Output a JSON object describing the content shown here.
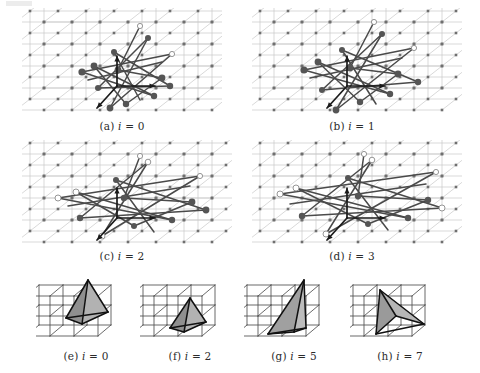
{
  "figure": {
    "kind": "multi-panel-scientific-figure",
    "background": "#ffffff",
    "rows": 3,
    "panel_count": 8
  },
  "colors": {
    "lattice_line": "#c9c9c9",
    "lattice_node": "#6f6f6f",
    "graph_edge": "#4a4a4a",
    "graph_node_dark": "#555555",
    "graph_node_hollow_fill": "#ffffff",
    "graph_node_hollow_stroke": "#8a8a8a",
    "axis_arrow": "#1a1a1a",
    "cube_wire": "#4f4f4f",
    "tetra_fill": "#9a9a9a",
    "tetra_fill_light": "#b4b4b4",
    "tetra_stroke": "#111111",
    "caption_text": "#2b2b2b"
  },
  "captions": {
    "a": {
      "tag": "(a)",
      "var": "i",
      "eq": "=",
      "value": "0",
      "full": "(a) i = 0"
    },
    "b": {
      "tag": "(b)",
      "var": "i",
      "eq": "=",
      "value": "1",
      "full": "(b) i = 1"
    },
    "c": {
      "tag": "(c)",
      "var": "i",
      "eq": "=",
      "value": "2",
      "full": "(c) i = 2"
    },
    "d": {
      "tag": "(d)",
      "var": "i",
      "eq": "=",
      "value": "3",
      "full": "(d) i = 3"
    },
    "e": {
      "tag": "(e)",
      "var": "i",
      "eq": "=",
      "value": "0",
      "full": "(e) i = 0"
    },
    "f": {
      "tag": "(f)",
      "var": "i",
      "eq": "=",
      "value": "2",
      "full": "(f) i = 2"
    },
    "g": {
      "tag": "(g)",
      "var": "i",
      "eq": "=",
      "value": "5",
      "full": "(g) i = 5"
    },
    "h": {
      "tag": "(h)",
      "var": "i",
      "eq": "=",
      "value": "7",
      "full": "(h) i = 7"
    }
  },
  "lattice": {
    "description": "3D cubic point lattice drawn in oblique projection",
    "cols": 8,
    "rows": 5,
    "depth_layers": 3,
    "cell_width": 28,
    "cell_height": 22,
    "depth_dx": 14,
    "depth_dy": -11,
    "node_size": 2.6
  },
  "graph_panels": [
    {
      "id": "a",
      "caption_key": "a",
      "spread": 0.0,
      "edge_count": 14,
      "node_count": 13,
      "hollow_nodes": 2,
      "has_axis_triad": true,
      "edges": [
        [
          118,
          18,
          96,
          62
        ],
        [
          96,
          62,
          140,
          70
        ],
        [
          140,
          70,
          104,
          96
        ],
        [
          104,
          96,
          72,
          58
        ],
        [
          72,
          58,
          132,
          88
        ],
        [
          132,
          88,
          60,
          64
        ],
        [
          60,
          64,
          150,
          46
        ],
        [
          150,
          46,
          88,
          100
        ],
        [
          88,
          100,
          126,
          30
        ],
        [
          126,
          30,
          76,
          80
        ],
        [
          76,
          80,
          148,
          78
        ],
        [
          148,
          78,
          92,
          44
        ],
        [
          92,
          44,
          118,
          92
        ],
        [
          66,
          72,
          140,
          54
        ]
      ],
      "nodes": [
        {
          "x": 96,
          "y": 62,
          "r": 3.4,
          "hollow": false
        },
        {
          "x": 140,
          "y": 70,
          "r": 3.4,
          "hollow": false
        },
        {
          "x": 104,
          "y": 96,
          "r": 3.2,
          "hollow": false
        },
        {
          "x": 72,
          "y": 58,
          "r": 3.4,
          "hollow": false
        },
        {
          "x": 132,
          "y": 88,
          "r": 3.2,
          "hollow": false
        },
        {
          "x": 60,
          "y": 64,
          "r": 3.6,
          "hollow": false
        },
        {
          "x": 88,
          "y": 100,
          "r": 3.4,
          "hollow": false
        },
        {
          "x": 126,
          "y": 30,
          "r": 3.0,
          "hollow": false
        },
        {
          "x": 76,
          "y": 80,
          "r": 3.0,
          "hollow": false
        },
        {
          "x": 148,
          "y": 78,
          "r": 3.2,
          "hollow": false
        },
        {
          "x": 92,
          "y": 44,
          "r": 3.0,
          "hollow": false
        },
        {
          "x": 118,
          "y": 18,
          "r": 2.6,
          "hollow": true
        },
        {
          "x": 150,
          "y": 46,
          "r": 2.6,
          "hollow": true
        }
      ]
    },
    {
      "id": "b",
      "caption_key": "b",
      "spread": 0.33,
      "edge_count": 14,
      "node_count": 13,
      "hollow_nodes": 2,
      "has_axis_triad": true,
      "edges": [
        [
          122,
          14,
          98,
          60
        ],
        [
          98,
          60,
          146,
          66
        ],
        [
          146,
          66,
          108,
          94
        ],
        [
          108,
          94,
          66,
          54
        ],
        [
          66,
          54,
          138,
          86
        ],
        [
          138,
          86,
          52,
          62
        ],
        [
          52,
          62,
          162,
          40
        ],
        [
          162,
          40,
          84,
          102
        ],
        [
          84,
          102,
          130,
          26
        ],
        [
          130,
          26,
          70,
          82
        ],
        [
          70,
          82,
          166,
          74
        ],
        [
          166,
          74,
          90,
          42
        ],
        [
          90,
          42,
          124,
          96
        ],
        [
          58,
          70,
          150,
          50
        ]
      ],
      "nodes": [
        {
          "x": 98,
          "y": 60,
          "r": 3.4,
          "hollow": false
        },
        {
          "x": 146,
          "y": 66,
          "r": 3.4,
          "hollow": false
        },
        {
          "x": 108,
          "y": 94,
          "r": 3.2,
          "hollow": false
        },
        {
          "x": 66,
          "y": 54,
          "r": 3.4,
          "hollow": false
        },
        {
          "x": 138,
          "y": 86,
          "r": 3.2,
          "hollow": false
        },
        {
          "x": 52,
          "y": 62,
          "r": 3.6,
          "hollow": false
        },
        {
          "x": 84,
          "y": 102,
          "r": 3.4,
          "hollow": false
        },
        {
          "x": 130,
          "y": 26,
          "r": 3.0,
          "hollow": false
        },
        {
          "x": 70,
          "y": 82,
          "r": 3.0,
          "hollow": false
        },
        {
          "x": 166,
          "y": 74,
          "r": 3.2,
          "hollow": false
        },
        {
          "x": 90,
          "y": 42,
          "r": 3.0,
          "hollow": false
        },
        {
          "x": 122,
          "y": 14,
          "r": 2.6,
          "hollow": true
        },
        {
          "x": 162,
          "y": 40,
          "r": 2.6,
          "hollow": true
        }
      ]
    },
    {
      "id": "c",
      "caption_key": "c",
      "spread": 0.66,
      "edge_count": 14,
      "node_count": 13,
      "hollow_nodes": 4,
      "has_axis_triad": true,
      "edges": [
        [
          118,
          16,
          102,
          58
        ],
        [
          102,
          58,
          170,
          62
        ],
        [
          170,
          62,
          112,
          86
        ],
        [
          112,
          86,
          54,
          52
        ],
        [
          54,
          52,
          150,
          80
        ],
        [
          150,
          80,
          36,
          58
        ],
        [
          36,
          58,
          178,
          36
        ],
        [
          178,
          36,
          80,
          96
        ],
        [
          80,
          96,
          126,
          22
        ],
        [
          126,
          22,
          58,
          78
        ],
        [
          58,
          78,
          184,
          70
        ],
        [
          184,
          70,
          94,
          40
        ],
        [
          94,
          40,
          132,
          92
        ],
        [
          46,
          66,
          168,
          46
        ]
      ],
      "nodes": [
        {
          "x": 102,
          "y": 58,
          "r": 3.2,
          "hollow": false
        },
        {
          "x": 170,
          "y": 62,
          "r": 3.4,
          "hollow": false
        },
        {
          "x": 112,
          "y": 86,
          "r": 3.0,
          "hollow": false
        },
        {
          "x": 54,
          "y": 52,
          "r": 3.0,
          "hollow": true
        },
        {
          "x": 150,
          "y": 80,
          "r": 3.2,
          "hollow": false
        },
        {
          "x": 36,
          "y": 58,
          "r": 3.0,
          "hollow": true
        },
        {
          "x": 80,
          "y": 96,
          "r": 3.0,
          "hollow": true
        },
        {
          "x": 126,
          "y": 22,
          "r": 2.8,
          "hollow": true
        },
        {
          "x": 58,
          "y": 78,
          "r": 3.2,
          "hollow": false
        },
        {
          "x": 184,
          "y": 70,
          "r": 3.4,
          "hollow": false
        },
        {
          "x": 94,
          "y": 40,
          "r": 3.0,
          "hollow": false
        },
        {
          "x": 118,
          "y": 16,
          "r": 2.6,
          "hollow": true
        },
        {
          "x": 178,
          "y": 36,
          "r": 2.6,
          "hollow": true
        }
      ]
    },
    {
      "id": "d",
      "caption_key": "d",
      "spread": 1.0,
      "edge_count": 14,
      "node_count": 13,
      "hollow_nodes": 5,
      "has_axis_triad": true,
      "edges": [
        [
          112,
          14,
          106,
          56
        ],
        [
          106,
          56,
          176,
          60
        ],
        [
          176,
          60,
          116,
          84
        ],
        [
          116,
          84,
          44,
          48
        ],
        [
          44,
          48,
          156,
          78
        ],
        [
          156,
          78,
          28,
          54
        ],
        [
          28,
          54,
          184,
          32
        ],
        [
          184,
          32,
          74,
          94
        ],
        [
          74,
          94,
          120,
          20
        ],
        [
          120,
          20,
          50,
          76
        ],
        [
          50,
          76,
          190,
          68
        ],
        [
          190,
          68,
          96,
          38
        ],
        [
          96,
          38,
          136,
          90
        ],
        [
          38,
          64,
          174,
          44
        ]
      ],
      "nodes": [
        {
          "x": 106,
          "y": 56,
          "r": 3.2,
          "hollow": false
        },
        {
          "x": 176,
          "y": 60,
          "r": 3.2,
          "hollow": false
        },
        {
          "x": 116,
          "y": 84,
          "r": 3.0,
          "hollow": false
        },
        {
          "x": 44,
          "y": 48,
          "r": 3.0,
          "hollow": true
        },
        {
          "x": 156,
          "y": 78,
          "r": 3.2,
          "hollow": false
        },
        {
          "x": 28,
          "y": 54,
          "r": 3.0,
          "hollow": true
        },
        {
          "x": 74,
          "y": 94,
          "r": 3.0,
          "hollow": true
        },
        {
          "x": 120,
          "y": 20,
          "r": 2.8,
          "hollow": true
        },
        {
          "x": 50,
          "y": 76,
          "r": 3.2,
          "hollow": false
        },
        {
          "x": 190,
          "y": 68,
          "r": 3.0,
          "hollow": true
        },
        {
          "x": 96,
          "y": 38,
          "r": 3.0,
          "hollow": false
        },
        {
          "x": 112,
          "y": 14,
          "r": 2.6,
          "hollow": true
        },
        {
          "x": 184,
          "y": 32,
          "r": 2.6,
          "hollow": true
        }
      ]
    }
  ],
  "axis_triad": {
    "origin": {
      "x": 95,
      "y": 78
    },
    "arrows": [
      {
        "name": "z-axis-arrow",
        "dx": 0,
        "dy": -30
      },
      {
        "name": "x-axis-arrow",
        "dx": 38,
        "dy": 0
      },
      {
        "name": "y-axis-arrow",
        "dx": -20,
        "dy": 22
      }
    ]
  },
  "tetra_panels": [
    {
      "id": "e",
      "caption_key": "e",
      "shape": "tetrahedron",
      "orientation": "tall-upright",
      "apex": {
        "x": 52,
        "y": 8
      },
      "left": {
        "x": 30,
        "y": 46
      },
      "right": {
        "x": 72,
        "y": 40
      },
      "front": {
        "x": 46,
        "y": 52
      },
      "fill_dark": "#8f8f8f",
      "fill_light": "#b2b2b2"
    },
    {
      "id": "f",
      "caption_key": "f",
      "shape": "tetrahedron",
      "orientation": "small-flat",
      "apex": {
        "x": 50,
        "y": 26
      },
      "left": {
        "x": 30,
        "y": 56
      },
      "right": {
        "x": 66,
        "y": 50
      },
      "front": {
        "x": 44,
        "y": 60
      },
      "fill_dark": "#8f8f8f",
      "fill_light": "#b2b2b2"
    },
    {
      "id": "g",
      "caption_key": "g",
      "shape": "tetrahedron",
      "orientation": "tall-narrow",
      "apex": {
        "x": 60,
        "y": 8
      },
      "left": {
        "x": 24,
        "y": 62
      },
      "right": {
        "x": 62,
        "y": 56
      },
      "front": {
        "x": 50,
        "y": 60
      },
      "fill_dark": "#a0a0a0",
      "fill_light": "#bcbcbc"
    },
    {
      "id": "h",
      "caption_key": "h",
      "shape": "tetrahedron",
      "orientation": "wide-leaning",
      "apex": {
        "x": 30,
        "y": 18
      },
      "left": {
        "x": 26,
        "y": 62
      },
      "right": {
        "x": 74,
        "y": 52
      },
      "front": {
        "x": 46,
        "y": 44
      },
      "fill_dark": "#9a9a9a",
      "fill_light": "#b6b6b6"
    }
  ],
  "cube_lattice": {
    "description": "white 3D cube wireframe lattice, oblique projection",
    "cols": 4,
    "rows": 3,
    "cell_w": 24,
    "cell_h": 20,
    "depth_dx": 13,
    "depth_dy": -11
  }
}
